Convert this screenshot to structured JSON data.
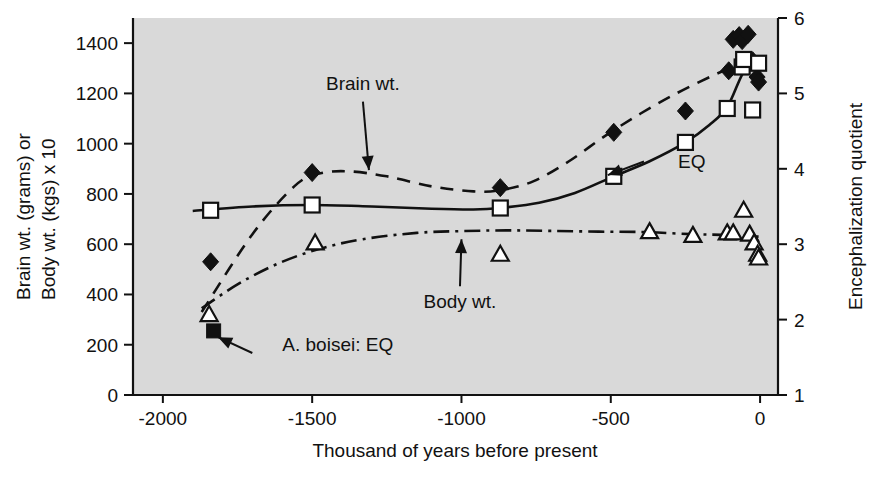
{
  "chart_data": {
    "type": "line",
    "title": "",
    "subtitle": "",
    "xlabel": "Thousand of years before present",
    "ylabel": "Brain wt. (grams) or Body wt. (kgs) x 10",
    "y2label": "Encephalization quotient",
    "xlim": [
      -2100,
      60
    ],
    "ylim": [
      0,
      1500
    ],
    "y2lim": [
      1,
      6
    ],
    "grid": false,
    "legend": "none (inline arrow annotations)",
    "plot_background": "#d9d9d9",
    "line_color": "#111111",
    "xticks": [
      -2000,
      -1500,
      -1000,
      -500,
      0
    ],
    "xticklabels": [
      "-2000",
      "-1500",
      "-1000",
      "-500",
      "0"
    ],
    "yticks": [
      0,
      200,
      400,
      600,
      800,
      1000,
      1200,
      1400
    ],
    "yticklabels": [
      "0",
      "200",
      "400",
      "600",
      "800",
      "1000",
      "1200",
      "1400"
    ],
    "y2ticks": [
      1,
      2,
      3,
      4,
      5,
      6
    ],
    "y2ticklabels": [
      "1",
      "2",
      "3",
      "4",
      "5",
      "6"
    ],
    "series": [
      {
        "name": "Brain wt.",
        "marker": "filled-diamond",
        "linestyle": "dashed",
        "axis": "left",
        "points": [
          [
            -1840,
            530
          ],
          [
            -1500,
            885
          ],
          [
            -870,
            825
          ],
          [
            -490,
            1045
          ],
          [
            -250,
            1130
          ],
          [
            -105,
            1290
          ],
          [
            -90,
            1415
          ],
          [
            -70,
            1430
          ],
          [
            -60,
            1410
          ],
          [
            -40,
            1435
          ],
          [
            -25,
            1330
          ],
          [
            -10,
            1265
          ],
          [
            -5,
            1245
          ]
        ],
        "curve": [
          [
            -1870,
            330
          ],
          [
            -1700,
            640
          ],
          [
            -1560,
            830
          ],
          [
            -1480,
            880
          ],
          [
            -1380,
            890
          ],
          [
            -1250,
            870
          ],
          [
            -1100,
            830
          ],
          [
            -960,
            810
          ],
          [
            -870,
            815
          ],
          [
            -760,
            850
          ],
          [
            -640,
            930
          ],
          [
            -520,
            1030
          ],
          [
            -400,
            1120
          ],
          [
            -280,
            1200
          ],
          [
            -160,
            1270
          ],
          [
            -60,
            1320
          ],
          [
            -5,
            1330
          ]
        ]
      },
      {
        "name": "EQ",
        "marker": "open-square",
        "linestyle": "solid",
        "axis": "right",
        "points": [
          [
            -1840,
            3.45
          ],
          [
            -1500,
            3.52
          ],
          [
            -870,
            3.48
          ],
          [
            -490,
            3.9
          ],
          [
            -250,
            4.35
          ],
          [
            -110,
            4.8
          ],
          [
            -60,
            5.35
          ],
          [
            -55,
            5.45
          ],
          [
            -25,
            4.78
          ],
          [
            -5,
            5.4
          ]
        ],
        "curve": [
          [
            -1900,
            3.44
          ],
          [
            -1700,
            3.5
          ],
          [
            -1500,
            3.52
          ],
          [
            -1300,
            3.5
          ],
          [
            -1100,
            3.47
          ],
          [
            -960,
            3.46
          ],
          [
            -870,
            3.48
          ],
          [
            -740,
            3.55
          ],
          [
            -620,
            3.68
          ],
          [
            -490,
            3.9
          ],
          [
            -370,
            4.1
          ],
          [
            -250,
            4.35
          ],
          [
            -170,
            4.58
          ],
          [
            -110,
            4.82
          ],
          [
            -60,
            5.25
          ],
          [
            -20,
            5.45
          ],
          [
            -5,
            5.48
          ]
        ]
      },
      {
        "name": "Body wt.",
        "marker": "open-triangle",
        "linestyle": "dash-dot",
        "axis": "left",
        "points": [
          [
            -1845,
            320
          ],
          [
            -1490,
            605
          ],
          [
            -870,
            560
          ],
          [
            -370,
            650
          ],
          [
            -225,
            635
          ],
          [
            -110,
            645
          ],
          [
            -90,
            645
          ],
          [
            -55,
            735
          ],
          [
            -35,
            640
          ],
          [
            -20,
            605
          ],
          [
            -8,
            560
          ],
          [
            -5,
            545
          ]
        ],
        "curve": [
          [
            -1870,
            345
          ],
          [
            -1750,
            440
          ],
          [
            -1620,
            520
          ],
          [
            -1480,
            580
          ],
          [
            -1330,
            620
          ],
          [
            -1150,
            645
          ],
          [
            -1000,
            652
          ],
          [
            -850,
            655
          ],
          [
            -700,
            653
          ],
          [
            -540,
            650
          ],
          [
            -380,
            648
          ],
          [
            -230,
            640
          ],
          [
            -110,
            637
          ],
          [
            -40,
            632
          ],
          [
            -5,
            630
          ]
        ]
      },
      {
        "name": "A. boisei: EQ",
        "marker": "filled-square",
        "linestyle": "none",
        "axis": "left",
        "points": [
          [
            -1830,
            255
          ]
        ]
      }
    ],
    "annotations": [
      {
        "text": "Brain wt.",
        "label_xy": [
          -1330,
          1215
        ],
        "arrow_to": [
          -1310,
          895
        ],
        "arrow_dir": "down"
      },
      {
        "text": "EQ",
        "label_xy": [
          -275,
          905
        ],
        "arrow_to": [
          -510,
          875
        ],
        "arrow_dir": "left"
      },
      {
        "text": "Body wt.",
        "label_xy": [
          -1005,
          345
        ],
        "arrow_to": [
          -1000,
          620
        ],
        "arrow_dir": "up"
      },
      {
        "text": "A. boisei: EQ",
        "label_xy": [
          -1600,
          175
        ],
        "arrow_to": [
          -1815,
          230
        ],
        "arrow_dir": "upleft"
      }
    ]
  }
}
